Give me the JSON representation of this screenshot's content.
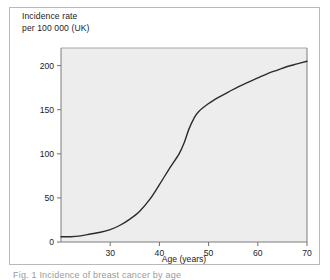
{
  "figure": {
    "background": "#ffffff",
    "frame_color": "#b9b9b9",
    "caption_partial": "Fig. 1 Incidence of breast cancer by age"
  },
  "chart_data": {
    "type": "line",
    "title": "",
    "ylabel": "Incidence rate\nper 100 000 (UK)",
    "ylabel_line1": "Incidence rate",
    "ylabel_line2": "per 100 000 (UK)",
    "xlabel": "Age (years)",
    "xlim": [
      20,
      70
    ],
    "ylim": [
      0,
      220
    ],
    "xticks": [
      30,
      40,
      50,
      60,
      70
    ],
    "xtick_labels": [
      "30",
      "40",
      "50",
      "60",
      "70"
    ],
    "yticks": [
      0,
      50,
      100,
      150,
      200
    ],
    "ytick_labels": [
      "0",
      "50",
      "100",
      "150",
      "200"
    ],
    "grid": false,
    "legend": "none",
    "plot_background": "#ededed",
    "line_color": "#2b2b2b",
    "line_width": 1.4,
    "series": [
      {
        "name": "Incidence rate per 100 000 (UK)",
        "x": [
          20,
          22,
          24,
          26,
          28,
          30,
          32,
          34,
          36,
          38,
          40,
          42,
          44,
          45,
          46,
          47,
          48,
          50,
          52,
          54,
          56,
          58,
          60,
          62,
          64,
          66,
          68,
          70
        ],
        "values": [
          6,
          6,
          7,
          9,
          11,
          14,
          19,
          26,
          35,
          48,
          65,
          83,
          100,
          112,
          128,
          140,
          148,
          157,
          164,
          170,
          176,
          181,
          186,
          191,
          195,
          199,
          202,
          205
        ]
      }
    ]
  }
}
